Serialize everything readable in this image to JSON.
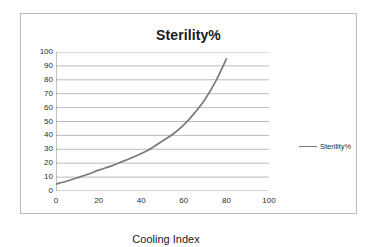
{
  "chart_data": {
    "type": "line",
    "title": "Sterility%",
    "xlabel": "Cooling Index",
    "ylabel": "",
    "xlim": [
      0,
      100
    ],
    "ylim": [
      0,
      100
    ],
    "grid": true,
    "legend_position": "right",
    "x_ticks": [
      0,
      20,
      40,
      60,
      80,
      100
    ],
    "y_ticks": [
      0,
      10,
      20,
      30,
      40,
      50,
      60,
      70,
      80,
      90,
      100
    ],
    "series": [
      {
        "name": "Sterility%",
        "color": "#7a7a7a",
        "x": [
          0,
          5,
          10,
          15,
          20,
          25,
          30,
          35,
          40,
          45,
          50,
          55,
          60,
          65,
          70,
          75,
          80
        ],
        "values": [
          5,
          7,
          9.5,
          12,
          15,
          17.5,
          20.5,
          23.5,
          27,
          31,
          36,
          41,
          47.5,
          56,
          66,
          79,
          95
        ]
      }
    ]
  },
  "legend": {
    "entries": [
      {
        "label": "Sterility%",
        "color": "#7a7a7a"
      }
    ]
  }
}
